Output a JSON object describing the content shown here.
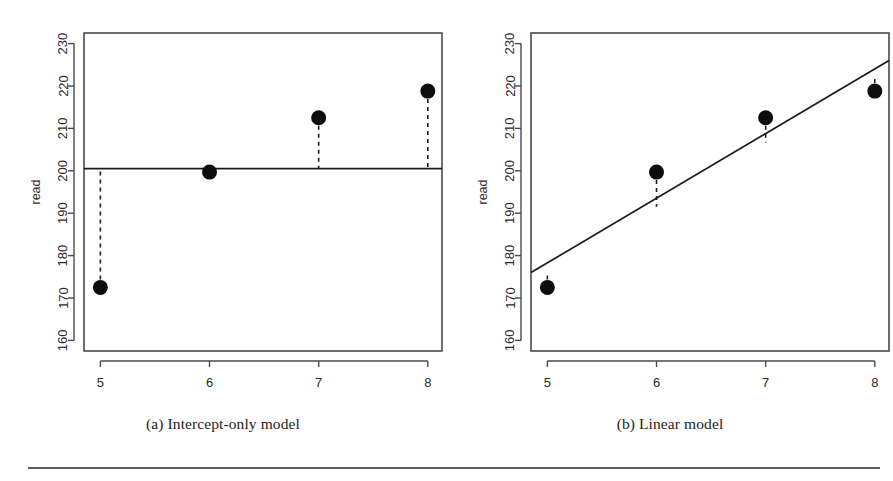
{
  "figure": {
    "panels": [
      {
        "id": "a",
        "caption": "(a) Intercept-only model",
        "xlabel": "grade",
        "ylabel": "read"
      },
      {
        "id": "b",
        "caption": "(b) Linear model",
        "xlabel": "grade",
        "ylabel": "read"
      }
    ]
  },
  "chart_data": [
    {
      "type": "scatter",
      "title": "(a) Intercept-only model",
      "xlabel": "grade",
      "ylabel": "read",
      "x": [
        5,
        6,
        7,
        8
      ],
      "values": [
        172.5,
        199.7,
        212.5,
        218.8
      ],
      "xlim": [
        4.85,
        8.13
      ],
      "ylim": [
        157.5,
        232.5
      ],
      "xticks": [
        5,
        6,
        7,
        8
      ],
      "yticks": [
        160,
        170,
        180,
        190,
        200,
        210,
        220,
        230
      ],
      "grid": false,
      "legend": null,
      "fit": {
        "kind": "horizontal-line",
        "label": "intercept-only fit",
        "intercept": 200.5,
        "slope": 0,
        "x_start": 4.85,
        "x_end": 8.13,
        "y_start": 200.5,
        "y_end": 200.5
      },
      "residuals": {
        "style": "dashed-vertical",
        "from_values": [
          172.5,
          199.7,
          212.5,
          218.8
        ],
        "to_values": [
          200.5,
          200.5,
          200.5,
          200.5
        ]
      }
    },
    {
      "type": "scatter",
      "title": "(b) Linear model",
      "xlabel": "grade",
      "ylabel": "read",
      "x": [
        5,
        6,
        7,
        8
      ],
      "values": [
        172.5,
        199.7,
        212.5,
        218.8
      ],
      "xlim": [
        4.85,
        8.13
      ],
      "ylim": [
        157.5,
        232.5
      ],
      "xticks": [
        5,
        6,
        7,
        8
      ],
      "yticks": [
        160,
        170,
        180,
        190,
        200,
        210,
        220,
        230
      ],
      "grid": false,
      "legend": null,
      "fit": {
        "kind": "regression-line",
        "label": "linear fit",
        "intercept": 100.0,
        "slope": 15.25,
        "x_start": 4.85,
        "x_end": 8.13,
        "y_start": 176.0,
        "y_end": 226.0
      },
      "residuals": {
        "style": "dashed-vertical",
        "from_values": [
          172.5,
          199.7,
          212.5,
          218.8
        ],
        "to_values": [
          176.2,
          191.5,
          206.7,
          222.0
        ]
      }
    }
  ],
  "style": {
    "axis_color": "#4a4a4a",
    "point_color": "#0d0d0d",
    "fit_line_color": "#1a1a1a",
    "residual_color": "#1a1a1a",
    "rule_color": "#5d5d5d",
    "background": "#ffffff",
    "point_radius": 7.5
  }
}
